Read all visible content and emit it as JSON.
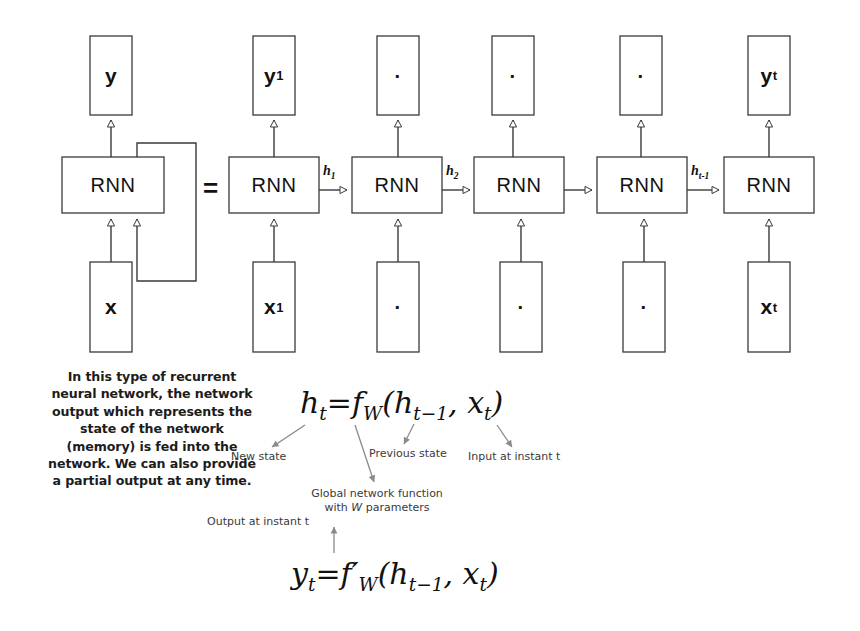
{
  "diagram": {
    "equality_symbol": "=",
    "folded": {
      "output_box": {
        "label": "y",
        "sub": ""
      },
      "cell_box": {
        "label": "RNN"
      },
      "input_box": {
        "label": "x",
        "sub": ""
      },
      "feedback_loop": "recurrent state fed back into the network"
    },
    "unrolled": {
      "output_boxes": [
        {
          "label": "y",
          "sub": "1",
          "is_dot": false
        },
        {
          "label": "",
          "sub": "",
          "is_dot": true
        },
        {
          "label": "",
          "sub": "",
          "is_dot": true
        },
        {
          "label": "",
          "sub": "",
          "is_dot": true
        },
        {
          "label": "y",
          "sub": "t",
          "is_dot": false
        }
      ],
      "cell_boxes": [
        {
          "label": "RNN"
        },
        {
          "label": "RNN"
        },
        {
          "label": "RNN"
        },
        {
          "label": "RNN"
        },
        {
          "label": "RNN"
        }
      ],
      "input_boxes": [
        {
          "label": "x",
          "sub": "1",
          "is_dot": false
        },
        {
          "label": "",
          "sub": "",
          "is_dot": true
        },
        {
          "label": "",
          "sub": "",
          "is_dot": true
        },
        {
          "label": "",
          "sub": "",
          "is_dot": true
        },
        {
          "label": "x",
          "sub": "t",
          "is_dot": false
        }
      ],
      "state_arrow_labels": [
        {
          "label": "h",
          "sub": "1"
        },
        {
          "label": "h",
          "sub": "2"
        },
        {
          "label": "",
          "sub": ""
        },
        {
          "label": "h",
          "sub": "t-1"
        }
      ]
    }
  },
  "description": {
    "text": "In this type of recurrent neural network, the network output which represents the state of the network (memory) is fed into the network. We can also provide a partial output at any time."
  },
  "equations": {
    "state": {
      "lhs_var": "h",
      "lhs_sub": "t",
      "equals": "=",
      "fn": "f",
      "fn_sub": "W",
      "args": "(h",
      "arg1_sub": "t−1",
      "sep": ", x",
      "arg2_sub": "t",
      "close": ")"
    },
    "output": {
      "lhs_var": "y",
      "lhs_sub": "t",
      "equals": "=",
      "fn": "f′",
      "fn_sub": "W",
      "args": "(h",
      "arg1_sub": "t−1",
      "sep": ", x",
      "arg2_sub": "t",
      "close": ")"
    }
  },
  "annotations": {
    "new_state": "New state",
    "previous_state": "Previous state",
    "input_at_instant": "Input at instant t",
    "global_function_line1": "Global network function",
    "global_function_line2_pre": "with ",
    "global_function_line2_var": "W",
    "global_function_line2_post": " parameters",
    "output_at_instant": "Output at instant t"
  },
  "style": {
    "stroke": "#3a3a3a",
    "ink": "#111111",
    "background": "#ffffff",
    "note_color": "#3a3a3a"
  }
}
